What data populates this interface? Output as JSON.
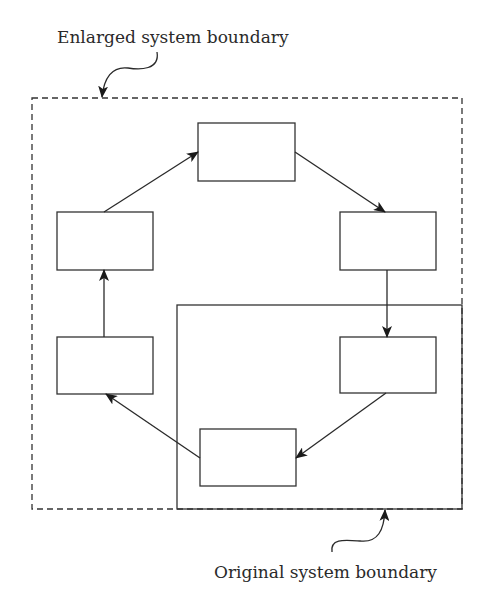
{
  "labels": {
    "enlarged": "Enlarged system boundary",
    "original": "Original system boundary"
  },
  "boundaries": {
    "enlarged": {
      "style": "dashed",
      "x": 32,
      "y": 98,
      "w": 430,
      "h": 411
    },
    "original": {
      "style": "solid",
      "x": 177,
      "y": 305,
      "w": 285,
      "h": 204
    }
  },
  "nodes": [
    {
      "id": "top",
      "x": 198,
      "y": 123,
      "w": 97,
      "h": 58
    },
    {
      "id": "right-upper",
      "x": 340,
      "y": 212,
      "w": 96,
      "h": 58
    },
    {
      "id": "right-lower",
      "x": 340,
      "y": 337,
      "w": 96,
      "h": 56
    },
    {
      "id": "bottom",
      "x": 200,
      "y": 429,
      "w": 96,
      "h": 57
    },
    {
      "id": "left-lower",
      "x": 57,
      "y": 337,
      "w": 96,
      "h": 57
    },
    {
      "id": "left-upper",
      "x": 57,
      "y": 212,
      "w": 96,
      "h": 58
    }
  ],
  "edges": [
    {
      "from": "top",
      "to": "right-upper"
    },
    {
      "from": "right-upper",
      "to": "right-lower"
    },
    {
      "from": "right-lower",
      "to": "bottom"
    },
    {
      "from": "bottom",
      "to": "left-lower"
    },
    {
      "from": "left-lower",
      "to": "left-upper"
    },
    {
      "from": "left-upper",
      "to": "top"
    }
  ],
  "colors": {
    "line": "#333333",
    "text": "#2a2a2a",
    "background": "#ffffff"
  }
}
